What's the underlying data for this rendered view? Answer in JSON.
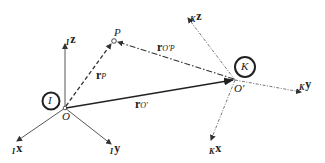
{
  "diagram": {
    "frames": [
      {
        "name": "I",
        "origin_label": "O",
        "axes": [
          "Ix",
          "Iy",
          "Iz"
        ]
      },
      {
        "name": "K",
        "origin_label": "O'",
        "axes": [
          "Kx",
          "Ky",
          "Kz"
        ]
      }
    ],
    "point": {
      "label": "P"
    },
    "vectors": [
      {
        "name": "r_P",
        "label": "r",
        "subscript": "P",
        "style": "dashed"
      },
      {
        "name": "r_O'",
        "label": "r",
        "subscript": "O'",
        "style": "solid"
      },
      {
        "name": "r_O'P",
        "label": "r",
        "subscript": "O'P",
        "style": "dash-dot"
      }
    ],
    "labels": {
      "frame_I": "I",
      "frame_K": "K",
      "origin_O": "O",
      "origin_Oprime": "O'",
      "point_P": "P",
      "Ix_pre": "I",
      "Ix": "x",
      "Iy_pre": "I",
      "Iy": "y",
      "Iz_pre": "I",
      "Iz": "z",
      "Kx_pre": "K",
      "Kx": "x",
      "Ky_pre": "K",
      "Ky": "y",
      "Kz_pre": "K",
      "Kz": "z",
      "rP": "r",
      "rP_sub": "P",
      "rO": "r",
      "rO_sub": "O'",
      "rOP": "r",
      "rOP_sub": "O'P"
    }
  }
}
